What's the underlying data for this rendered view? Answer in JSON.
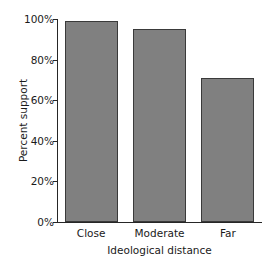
{
  "chart_data": {
    "type": "bar",
    "title": "",
    "categories": [
      "Close",
      "Moderate",
      "Far"
    ],
    "values": [
      99,
      95,
      71
    ],
    "xlabel": "Ideological distance",
    "ylabel": "Percent support",
    "ylim": [
      0,
      100
    ],
    "yticks": [
      0,
      20,
      40,
      60,
      80,
      100
    ],
    "ytick_labels": [
      "0%",
      "20%",
      "40%",
      "60%",
      "80%",
      "100%"
    ],
    "grid": false,
    "legend": null,
    "bar_color": "#808080",
    "bar_edge_color": "#3a3a3a",
    "axis_color": "#262626",
    "background_color": "#ffffff"
  }
}
